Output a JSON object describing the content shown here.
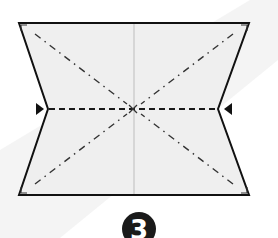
{
  "diagram": {
    "type": "origami-fold-step",
    "step_number": "3",
    "colors": {
      "background": "#ffffff",
      "background_band": "#f1f1f1",
      "paper_fill": "#efefef",
      "outline": "#111111",
      "center_crease": "#bdbdbd",
      "valley_fold": "#222222",
      "mountain_fold": "#333333",
      "arrow": "#111111",
      "step_badge_fill": "#1a1a1a",
      "step_badge_text": "#ffffff"
    },
    "shape": {
      "top_left": [
        19,
        23
      ],
      "top_right": [
        249,
        23
      ],
      "right_notch": [
        218,
        109
      ],
      "bottom_right": [
        249,
        195
      ],
      "bottom_left": [
        19,
        195
      ],
      "left_notch": [
        48,
        109
      ]
    },
    "center": [
      134,
      109
    ],
    "folds": [
      {
        "name": "horizontal-valley-fold",
        "style": "dashed",
        "from": [
          48,
          109
        ],
        "to": [
          218,
          109
        ]
      },
      {
        "name": "vertical-center-crease",
        "style": "solid-light",
        "from": [
          134,
          23
        ],
        "to": [
          134,
          195
        ]
      },
      {
        "name": "diagonal-top-left",
        "style": "dash-dot",
        "from": [
          34,
          34
        ],
        "to": [
          126,
          104
        ]
      },
      {
        "name": "diagonal-top-right",
        "style": "dash-dot",
        "from": [
          234,
          34
        ],
        "to": [
          142,
          104
        ]
      },
      {
        "name": "diagonal-bottom-left",
        "style": "dash-dot",
        "from": [
          34,
          184
        ],
        "to": [
          126,
          114
        ]
      },
      {
        "name": "diagonal-bottom-right",
        "style": "dash-dot",
        "from": [
          234,
          184
        ],
        "to": [
          142,
          114
        ]
      }
    ],
    "markers": [
      {
        "name": "left-push-arrow",
        "direction": "right",
        "position": [
          40,
          109
        ]
      },
      {
        "name": "right-push-arrow",
        "direction": "left",
        "position": [
          228,
          109
        ]
      }
    ]
  }
}
